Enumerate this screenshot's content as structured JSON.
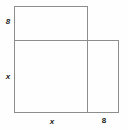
{
  "figure": {
    "background_color": "#fefefe",
    "stroke_color": "#8d8d8d",
    "label_color": "#1a1a1a",
    "labels": {
      "top_left_vertical": "8",
      "left_vertical": "x",
      "bottom_horizontal": "x",
      "bottom_right_horizontal": "8"
    },
    "shapes": {
      "top_rectangle": {
        "name": "top-rectangle",
        "x": 14,
        "y": 6,
        "width": 74,
        "height": 35
      },
      "lower_left_square": {
        "name": "lower-left-square",
        "x": 14,
        "y": 41,
        "width": 74,
        "height": 72
      },
      "lower_right_rectangle": {
        "name": "lower-right-rectangle",
        "x": 88,
        "y": 41,
        "width": 31,
        "height": 72
      }
    }
  }
}
